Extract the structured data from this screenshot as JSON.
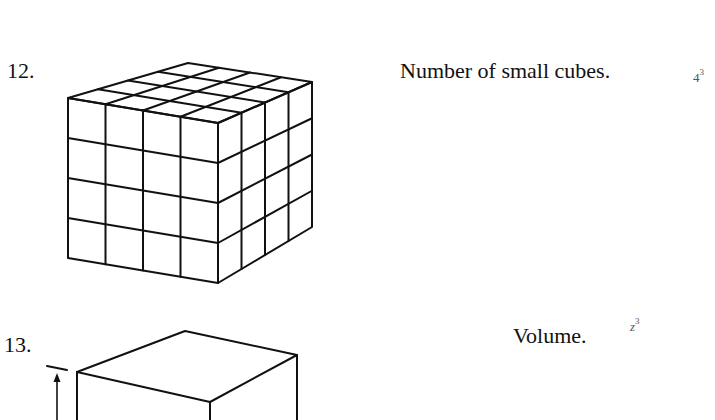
{
  "problems": [
    {
      "number": "12.",
      "prompt": "Number of small cubes.",
      "answer_base": "4",
      "answer_exp": "3",
      "figure": "4x4x4 cube subdivided into small cubes"
    },
    {
      "number": "13.",
      "prompt": "Volume.",
      "answer_base": "z",
      "answer_exp": "3",
      "figure": "cube with height dimension arrow"
    }
  ]
}
